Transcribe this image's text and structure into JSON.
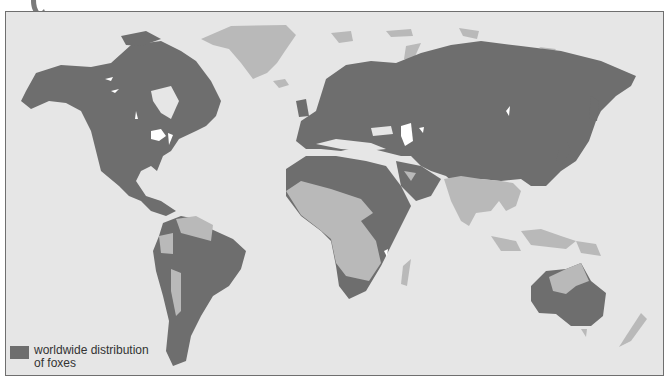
{
  "map": {
    "title_arrow": "pointer-arrow",
    "colors": {
      "ocean": "#e6e6e6",
      "fox_range": "#6e6e6e",
      "no_fox_land": "#b9b9b9",
      "lakes": "#ffffff",
      "border": "#6f6f6f"
    },
    "regions_with_foxes": [
      "North America",
      "Central America",
      "South America (east and south)",
      "Europe",
      "North Africa",
      "East Africa",
      "Southern Africa",
      "Arabian Peninsula",
      "Russia",
      "Central Asia",
      "China",
      "Japan",
      "Australia (south and center)"
    ],
    "regions_without_foxes": [
      "Greenland",
      "Iceland",
      "Svalbard",
      "West/Central Africa",
      "Madagascar",
      "India",
      "Southeast Asia",
      "Indonesia",
      "New Guinea",
      "Northern Australia",
      "New Zealand",
      "Northern South America",
      "Andes west coast"
    ]
  },
  "legend": {
    "line1": "worldwide distribution",
    "line2": "of foxes"
  }
}
